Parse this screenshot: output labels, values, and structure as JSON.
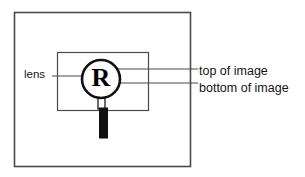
{
  "diagram": {
    "colors": {
      "stroke": "#4a4a4a",
      "ink": "#000000",
      "text": "#141414",
      "background": "#ffffff"
    },
    "outer_frame": {
      "name": "outer-image-frame",
      "x": 14,
      "y": 12,
      "width": 176,
      "height": 154
    },
    "inner_frame": {
      "name": "inner-image-frame",
      "x": 57,
      "y": 52,
      "width": 91,
      "height": 58
    },
    "lens": {
      "name": "magnifier-lens-circle",
      "cx": 101,
      "cy": 79,
      "r": 19,
      "letter": "R"
    },
    "handle": {
      "name": "magnifier-handle",
      "neck": {
        "x": 98,
        "y": 98,
        "width": 7,
        "height": 11
      },
      "bar": {
        "x": 99.5,
        "y": 109,
        "width": 8,
        "height": 29
      }
    },
    "leader_lines": [
      {
        "name": "leader-line-lens",
        "x1": 52,
        "y1": 76,
        "x2": 88,
        "y2": 76
      },
      {
        "name": "leader-line-top-of-image",
        "x1": 112,
        "y1": 69,
        "x2": 198,
        "y2": 69
      },
      {
        "name": "leader-line-bottom-of-image",
        "x1": 112,
        "y1": 83,
        "x2": 198,
        "y2": 83
      }
    ],
    "labels": {
      "lens": "lens",
      "top_of_image": "top of image",
      "bottom_of_image": "bottom of image"
    }
  }
}
